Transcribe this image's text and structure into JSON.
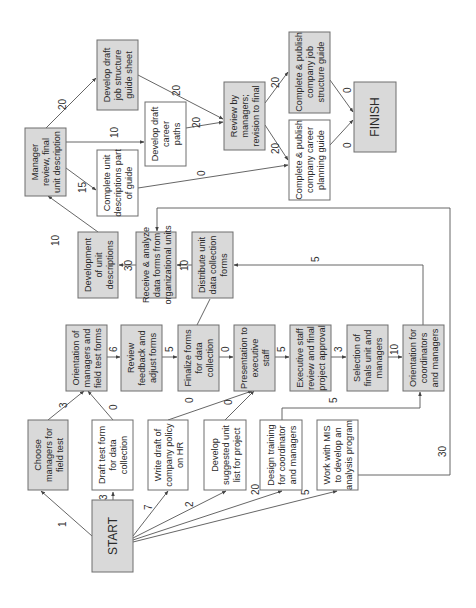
{
  "colors": {
    "gray_fill": "#d9d9d9",
    "white_fill": "#ffffff",
    "border": "#6e6e6e",
    "line": "#555555"
  },
  "nodes": {
    "start": {
      "lines": [
        "START"
      ],
      "fill": "gray"
    },
    "choose_managers": {
      "lines": [
        "Choose",
        "managers for",
        "field test"
      ],
      "fill": "gray"
    },
    "draft_test_form": {
      "lines": [
        "Draft test form",
        "for data",
        "collection"
      ],
      "fill": "white"
    },
    "write_policy": {
      "lines": [
        "Write draft of",
        "company policy",
        "on HR"
      ],
      "fill": "white"
    },
    "develop_unit_list": {
      "lines": [
        "Develop",
        "suggested unit",
        "list for project"
      ],
      "fill": "white"
    },
    "design_training": {
      "lines": [
        "Design training",
        "for coordinator",
        "and managers"
      ],
      "fill": "white"
    },
    "work_with_mis": {
      "lines": [
        "Work with MIS",
        "to develop an",
        "analysis program"
      ],
      "fill": "white"
    },
    "orientation_field": {
      "lines": [
        "Orientation of",
        "managers and",
        "field test forms"
      ],
      "fill": "gray"
    },
    "review_feedback": {
      "lines": [
        "Review",
        "feedback and",
        "adjust forms"
      ],
      "fill": "gray"
    },
    "finalize_forms": {
      "lines": [
        "Finalize forms",
        "for data",
        "collection"
      ],
      "fill": "gray"
    },
    "presentation": {
      "lines": [
        "Presentation to",
        "executive",
        "staff"
      ],
      "fill": "gray"
    },
    "exec_review": {
      "lines": [
        "Executive staff",
        "review and final",
        "project approval"
      ],
      "fill": "gray"
    },
    "selection_finals": {
      "lines": [
        "Selection of",
        "finals unit and",
        "managers"
      ],
      "fill": "gray"
    },
    "orientation_coord": {
      "lines": [
        "Orientation for",
        "coordinators",
        "and managers"
      ],
      "fill": "gray"
    },
    "development_unit_desc": {
      "lines": [
        "Development",
        "of unit",
        "descriptions"
      ],
      "fill": "gray"
    },
    "receive_analyze": {
      "lines": [
        "Receive & analyze",
        "data forms from",
        "organizational units"
      ],
      "fill": "gray"
    },
    "distribute_forms": {
      "lines": [
        "Distribute unit",
        "data collection",
        "forms"
      ],
      "fill": "gray"
    },
    "manager_review_final": {
      "lines": [
        "Manager",
        "review, final",
        "unit description"
      ],
      "fill": "gray"
    },
    "complete_unit_desc": {
      "lines": [
        "Complete unit",
        "descriptions part",
        "of guide"
      ],
      "fill": "white"
    },
    "draft_job_structure": {
      "lines": [
        "Develop draft",
        "job structure",
        "guide sheet"
      ],
      "fill": "gray"
    },
    "draft_career_paths": {
      "lines": [
        "Develop draft",
        "career",
        "paths"
      ],
      "fill": "white"
    },
    "review_by_managers": {
      "lines": [
        "Review by",
        "managers;",
        "revision to final"
      ],
      "fill": "gray"
    },
    "publish_job_guide": {
      "lines": [
        "Complete & publish",
        "company job",
        "structure guide"
      ],
      "fill": "gray"
    },
    "publish_career_guide": {
      "lines": [
        "Complete & publish",
        "company career",
        "planning guide"
      ],
      "fill": "white"
    },
    "finish": {
      "lines": [
        "FINISH"
      ],
      "fill": "gray"
    }
  },
  "edges": [
    {
      "from": "start",
      "to": "choose_managers",
      "weight": "1"
    },
    {
      "from": "start",
      "to": "draft_test_form",
      "weight": "3"
    },
    {
      "from": "start",
      "to": "write_policy",
      "weight": "7"
    },
    {
      "from": "start",
      "to": "develop_unit_list",
      "weight": "2"
    },
    {
      "from": "start",
      "to": "design_training",
      "weight": "20"
    },
    {
      "from": "start",
      "to": "work_with_mis",
      "weight": "5"
    },
    {
      "from": "choose_managers",
      "to": "orientation_field",
      "weight": "3"
    },
    {
      "from": "draft_test_form",
      "to": "orientation_field",
      "weight": "0"
    },
    {
      "from": "orientation_field",
      "to": "review_feedback",
      "weight": "6"
    },
    {
      "from": "review_feedback",
      "to": "finalize_forms",
      "weight": "5"
    },
    {
      "from": "write_policy",
      "to": "presentation",
      "weight": "0"
    },
    {
      "from": "develop_unit_list",
      "to": "presentation",
      "weight": "0"
    },
    {
      "from": "finalize_forms",
      "to": "presentation",
      "weight": "0"
    },
    {
      "from": "finalize_forms",
      "to": "distribute_forms",
      "weight": ""
    },
    {
      "from": "presentation",
      "to": "exec_review",
      "weight": "5"
    },
    {
      "from": "exec_review",
      "to": "selection_finals",
      "weight": "3"
    },
    {
      "from": "selection_finals",
      "to": "orientation_coord",
      "weight": "10"
    },
    {
      "from": "design_training",
      "to": "orientation_coord",
      "weight": "5"
    },
    {
      "from": "orientation_coord",
      "to": "distribute_forms",
      "weight": "5"
    },
    {
      "from": "work_with_mis",
      "to": "receive_analyze",
      "weight": "30"
    },
    {
      "from": "distribute_forms",
      "to": "receive_analyze",
      "weight": "10"
    },
    {
      "from": "receive_analyze",
      "to": "development_unit_desc",
      "weight": "30"
    },
    {
      "from": "development_unit_desc",
      "to": "manager_review_final",
      "weight": "10"
    },
    {
      "from": "manager_review_final",
      "to": "draft_job_structure",
      "weight": "20"
    },
    {
      "from": "manager_review_final",
      "to": "draft_career_paths",
      "weight": "10"
    },
    {
      "from": "manager_review_final",
      "to": "complete_unit_desc",
      "weight": "15"
    },
    {
      "from": "draft_job_structure",
      "to": "review_by_managers",
      "weight": "20"
    },
    {
      "from": "draft_career_paths",
      "to": "review_by_managers",
      "weight": "20"
    },
    {
      "from": "complete_unit_desc",
      "to": "publish_career_guide",
      "weight": "0"
    },
    {
      "from": "review_by_managers",
      "to": "publish_job_guide",
      "weight": "20"
    },
    {
      "from": "review_by_managers",
      "to": "publish_career_guide",
      "weight": "20"
    },
    {
      "from": "publish_job_guide",
      "to": "finish",
      "weight": "0"
    },
    {
      "from": "publish_career_guide",
      "to": "finish",
      "weight": "0"
    }
  ]
}
